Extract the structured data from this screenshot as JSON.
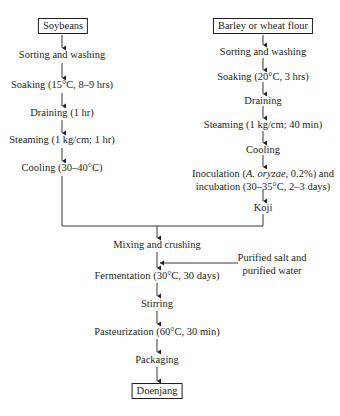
{
  "diagram": {
    "left_branch": {
      "start": "Soybeans",
      "steps": [
        "Sorting and washing",
        "Soaking (15°C, 8–9 hrs)",
        "Draining (1 hr)",
        "Steaming (1 kg/cm; 1 hr)",
        "Cooling (30–40°C)"
      ]
    },
    "right_branch": {
      "start": "Barley or wheat flour",
      "steps": [
        "Sorting and washing",
        "Soaking (20°C, 3 hrs)",
        "Draining",
        "Steaming (1 kg/cm; 40 min)",
        "Cooling"
      ],
      "inoculation": {
        "line1_prefix": "Inoculation (",
        "organism": "A. oryzae",
        "line1_suffix": ", 0.2%) and",
        "line2": "incubation (30–35°C, 2–3 days)"
      },
      "end": "Koji"
    },
    "merged": {
      "steps": [
        "Mixing and crushing",
        "Fermentation (30°C, 30 days)",
        "Stirring",
        "Pasteurization (60°C, 30 min)",
        "Packaging"
      ],
      "side_input": {
        "line1": "Purified salt and",
        "line2": "purified water"
      },
      "end": "Doenjang"
    }
  }
}
